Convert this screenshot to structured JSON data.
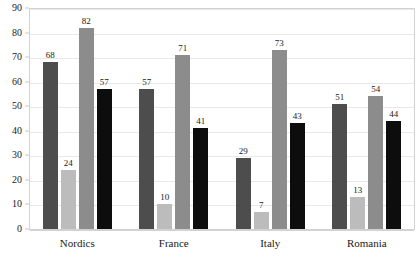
{
  "chart_data": {
    "type": "bar",
    "title": "",
    "subtitle": "",
    "xlabel": "",
    "ylabel": "",
    "categories": [
      "Nordics",
      "France",
      "Italy",
      "Romania"
    ],
    "series": [
      {
        "name": "series-1",
        "color": "#4d4d4d",
        "values": [
          68,
          57,
          29,
          51
        ]
      },
      {
        "name": "series-2",
        "color": "#bcbcbc",
        "values": [
          24,
          10,
          7,
          13
        ]
      },
      {
        "name": "series-3",
        "color": "#8c8c8c",
        "values": [
          82,
          71,
          73,
          54
        ]
      },
      {
        "name": "series-4",
        "color": "#0d0d0d",
        "values": [
          57,
          41,
          43,
          44
        ]
      }
    ],
    "ylim": [
      0,
      90
    ],
    "y_ticks": [
      0,
      10,
      20,
      30,
      40,
      50,
      60,
      70,
      80,
      90
    ],
    "y_tick_labels": [
      "0",
      "10",
      "20",
      "30",
      "40",
      "50",
      "60",
      "70",
      "80",
      "90"
    ],
    "grid": true,
    "grid_axis": "y",
    "legend": false,
    "legend_position": "none",
    "data_labels": true,
    "data_label_values": [
      [
        "68",
        "24",
        "82",
        "57"
      ],
      [
        "57",
        "10",
        "71",
        "41"
      ],
      [
        "29",
        "7",
        "73",
        "43"
      ],
      [
        "51",
        "13",
        "54",
        "44"
      ]
    ],
    "frame": true,
    "background_color": "#ffffff",
    "grid_color": "#e9e9e9",
    "frame_color": "#d2d2d2",
    "text_color": "#1a1a1a"
  }
}
